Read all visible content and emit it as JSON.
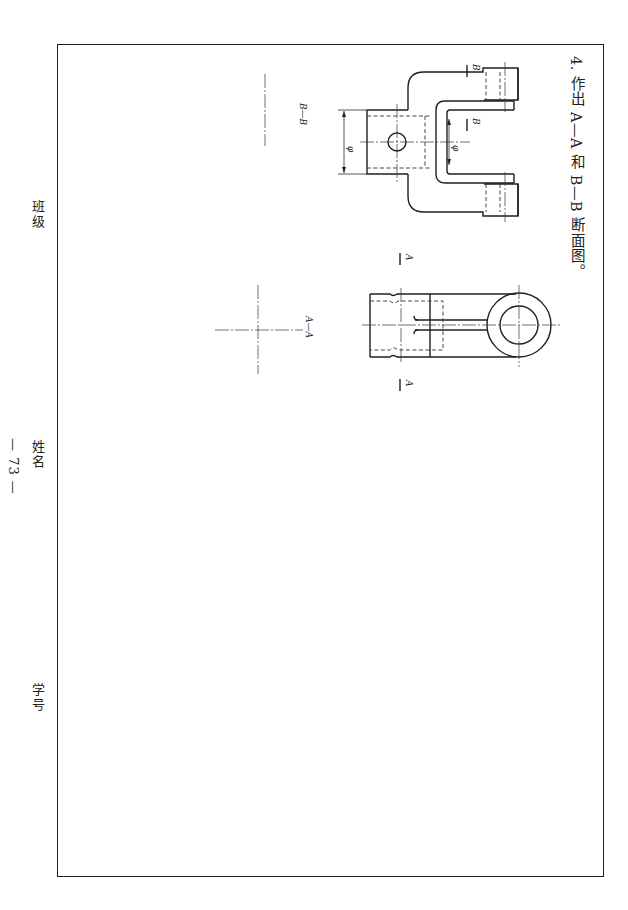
{
  "page": {
    "orientation": "rotated-90-clockwise",
    "problem": {
      "number": "4.",
      "instruction": "作出 A—A 和 B—B 断面图。"
    },
    "footer": {
      "class_label": "班级",
      "name_label": "姓名",
      "student_id_label": "学号",
      "page_number": "— 73 —"
    }
  },
  "drawings": {
    "fork_part": {
      "section_marks": [
        "B",
        "B"
      ],
      "dimension_labels": [
        "φ",
        "φ"
      ],
      "section_view_label": "B—B"
    },
    "eye_part": {
      "section_marks": [
        "A",
        "A"
      ],
      "section_view_label": "A—A"
    }
  },
  "colors": {
    "ink": "#1f1f1f",
    "paper": "#ffffff"
  }
}
